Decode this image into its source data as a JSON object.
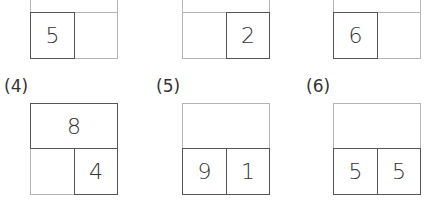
{
  "problems": [
    {
      "label": "",
      "top": "",
      "bottom_left": "5",
      "bottom_right": ""
    },
    {
      "label": "",
      "top": "",
      "bottom_left": "",
      "bottom_right": "2"
    },
    {
      "label": "",
      "top": "",
      "bottom_left": "6",
      "bottom_right": ""
    },
    {
      "label": "(4)",
      "top": "8",
      "bottom_left": "",
      "bottom_right": "4"
    },
    {
      "label": "(5)",
      "top": "",
      "bottom_left": "9",
      "bottom_right": "1"
    },
    {
      "label": "(6)",
      "top": "",
      "bottom_left": "5",
      "bottom_right": "5"
    }
  ]
}
